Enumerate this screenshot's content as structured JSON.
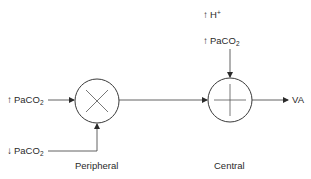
{
  "diagram": {
    "type": "feedback-control",
    "nodes": {
      "peripheral": {
        "label": "Peripheral",
        "symbol": "multiply",
        "glyph": "×"
      },
      "central": {
        "label": "Central",
        "symbol": "sum",
        "glyph": "+"
      }
    },
    "inputs": {
      "peripheral_high": {
        "arrow": "↑",
        "name": "PaCO",
        "sub": "2"
      },
      "peripheral_low": {
        "arrow": "↓",
        "name": "PaCO",
        "sub": "2"
      },
      "central_h": {
        "arrow": "↑",
        "name": "H",
        "sup": "+"
      },
      "central_paco2": {
        "arrow": "↑",
        "name": "PaCO",
        "sub": "2"
      }
    },
    "output": {
      "label": "VA"
    },
    "edges": [
      {
        "from": "↑ PaCO2",
        "to": "Peripheral"
      },
      {
        "from": "↓ PaCO2",
        "to": "Peripheral"
      },
      {
        "from": "Peripheral",
        "to": "Central"
      },
      {
        "from": "↑ H+",
        "to": "Central"
      },
      {
        "from": "↑ PaCO2 (central)",
        "to": "Central"
      },
      {
        "from": "Central",
        "to": "VA"
      }
    ],
    "colors": {
      "line": "#3a3a3a",
      "text": "#2a2a2a",
      "background": "#ffffff"
    }
  }
}
